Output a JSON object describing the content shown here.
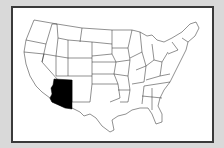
{
  "map": {
    "type": "us-states-outline",
    "highlighted_state": "Arizona",
    "highlight_color": "#000000",
    "state_fill": "#ffffff",
    "outline_color": "#222222",
    "background_color": "#d9d9d9",
    "frame_color": "#3a3a3a"
  }
}
